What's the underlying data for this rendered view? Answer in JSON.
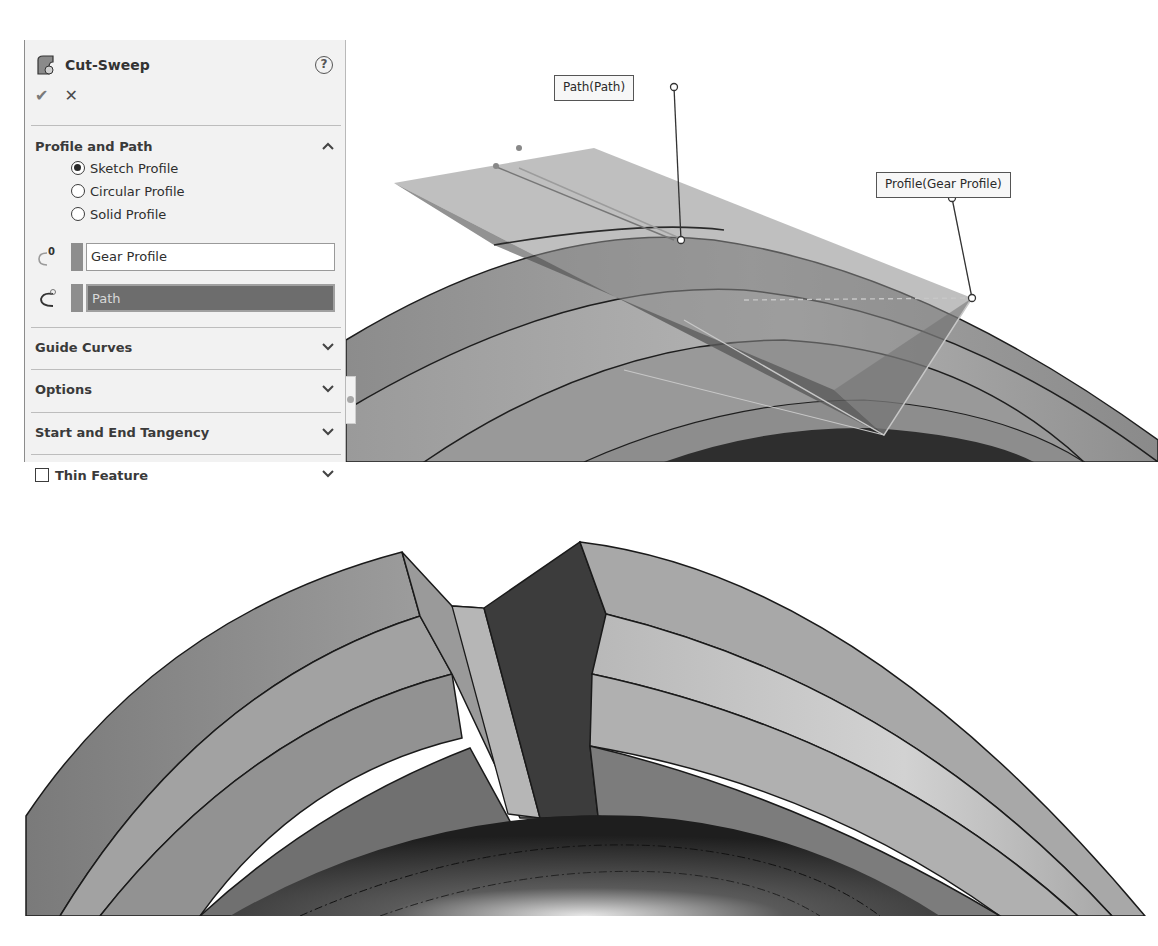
{
  "property_manager": {
    "title": "Cut-Sweep",
    "help_icon": "?",
    "ok_icon": "✔",
    "cancel_icon": "✕",
    "sections": {
      "profile_and_path": {
        "label": "Profile and Path",
        "expanded": true,
        "radio_options": [
          {
            "label": "Sketch Profile",
            "selected": true
          },
          {
            "label": "Circular Profile",
            "selected": false
          },
          {
            "label": "Solid Profile",
            "selected": false
          }
        ],
        "profile_selection": {
          "value": "Gear Profile",
          "icon_badge": "0"
        },
        "path_selection": {
          "value": "Path",
          "active": true
        }
      },
      "guide_curves": {
        "label": "Guide Curves",
        "expanded": false
      },
      "options": {
        "label": "Options",
        "expanded": false
      },
      "start_end_tangency": {
        "label": "Start and End Tangency",
        "expanded": false
      },
      "thin_feature": {
        "label": "Thin Feature",
        "checked": false,
        "expanded": false
      }
    }
  },
  "viewport_top": {
    "callouts": {
      "path": "Path(Path)",
      "profile": "Profile(Gear Profile)"
    }
  },
  "colors": {
    "panel_bg": "#f2f2f2",
    "active_selection": "#6d6d6d",
    "model_mid": "#9a9a9a",
    "model_dark": "#3a3a3a",
    "model_light": "#c4c4c4"
  }
}
